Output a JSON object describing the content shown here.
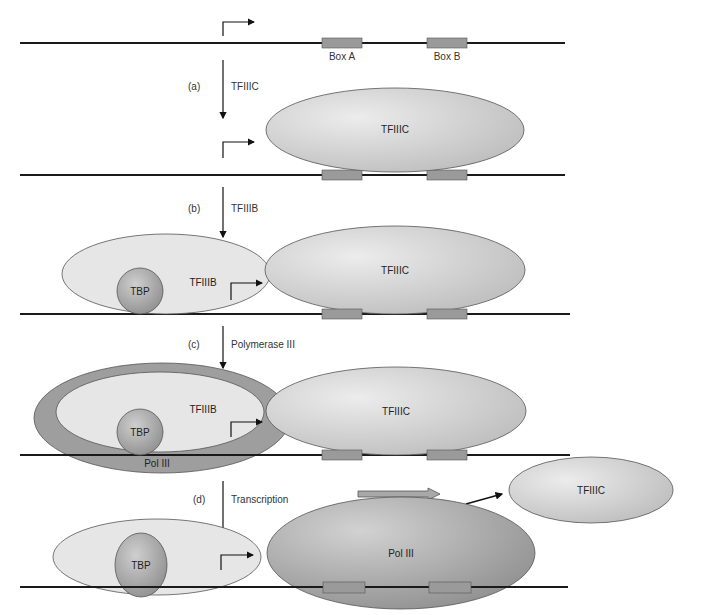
{
  "figure": {
    "steps": [
      {
        "letter": "(a)",
        "label": "TFIIIC"
      },
      {
        "letter": "(b)",
        "label": "TFIIIB"
      },
      {
        "letter": "(c)",
        "label": "Polymerase III"
      },
      {
        "letter": "(d)",
        "label": "Transcription"
      }
    ],
    "boxes": {
      "a": "Box A",
      "b": "Box B"
    },
    "factors": {
      "tfiiic": "TFIIIC",
      "tfiiib": "TFIIIB",
      "tbp": "TBP",
      "pol3": "Pol III"
    },
    "colors": {
      "dna": "#1a1a1a",
      "box": "#9a9a9a",
      "tfiiic": "#c4c4c4",
      "tfiiib": "#e6e6e6",
      "tbp": "#a8a8a8",
      "pol3": "#9e9e9e"
    }
  }
}
